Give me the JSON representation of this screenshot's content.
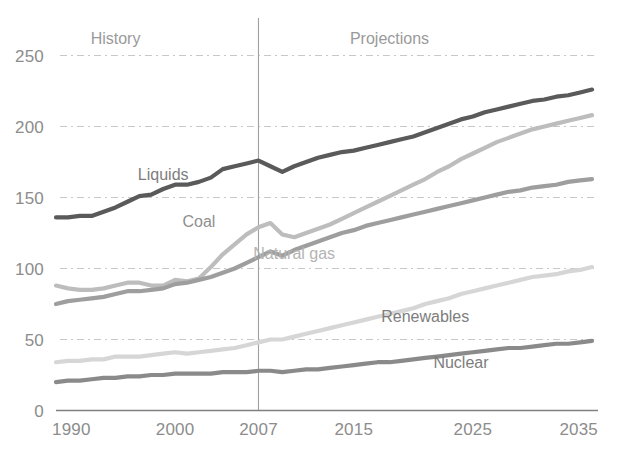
{
  "chart_data": {
    "type": "line",
    "title": "",
    "subtitle": "",
    "xlabel": "",
    "ylabel": "",
    "xlim": [
      1990,
      2035
    ],
    "ylim": [
      0,
      260
    ],
    "grid": true,
    "grid_style": "dashed-horizontal",
    "legend_position": "inline-annotations",
    "x_ticks": [
      "1990",
      "2000",
      "2007",
      "2015",
      "2025",
      "2035"
    ],
    "x_tick_values": [
      1990,
      2000,
      2007,
      2015,
      2025,
      2035
    ],
    "y_ticks": [
      "0",
      "50",
      "100",
      "150",
      "200",
      "250"
    ],
    "y_tick_values": [
      0,
      50,
      100,
      150,
      200,
      250
    ],
    "annotations": [
      {
        "name": "history",
        "text": "History",
        "x": 1995,
        "y": 258
      },
      {
        "name": "projections",
        "text": "Projections",
        "x": 2018,
        "y": 258
      },
      {
        "name": "history-projection-divider",
        "text": "",
        "x": 2007,
        "y": 0
      }
    ],
    "divider_x": 2007,
    "x": [
      1990,
      1991,
      1992,
      1993,
      1994,
      1995,
      1996,
      1997,
      1998,
      1999,
      2000,
      2001,
      2002,
      2003,
      2004,
      2005,
      2006,
      2007,
      2008,
      2009,
      2010,
      2011,
      2012,
      2013,
      2014,
      2015,
      2016,
      2017,
      2018,
      2019,
      2020,
      2021,
      2022,
      2023,
      2024,
      2025,
      2026,
      2027,
      2028,
      2029,
      2030,
      2031,
      2032,
      2033,
      2034,
      2035
    ],
    "series": [
      {
        "name": "Liquids",
        "label": "Liquids",
        "color": "#5a5a5a",
        "label_x": 1999,
        "label_y": 162,
        "values": [
          136,
          136,
          137,
          137,
          140,
          143,
          147,
          151,
          152,
          156,
          159,
          159,
          161,
          164,
          170,
          172,
          174,
          176,
          172,
          168,
          172,
          175,
          178,
          180,
          182,
          183,
          185,
          187,
          189,
          191,
          193,
          196,
          199,
          202,
          205,
          207,
          210,
          212,
          214,
          216,
          218,
          219,
          221,
          222,
          224,
          226
        ]
      },
      {
        "name": "Coal",
        "label": "Coal",
        "color": "#bdbdbd",
        "label_x": 2002,
        "label_y": 129,
        "values": [
          88,
          86,
          85,
          85,
          86,
          88,
          90,
          90,
          88,
          88,
          92,
          91,
          93,
          101,
          110,
          117,
          124,
          129,
          132,
          124,
          122,
          125,
          128,
          131,
          135,
          139,
          143,
          147,
          151,
          155,
          159,
          163,
          168,
          172,
          177,
          181,
          185,
          189,
          192,
          195,
          198,
          200,
          202,
          204,
          206,
          208
        ]
      },
      {
        "name": "Natural gas",
        "label": "Natural gas",
        "color": "#9e9e9e",
        "label_x": 2010,
        "label_y": 107,
        "values": [
          75,
          77,
          78,
          79,
          80,
          82,
          84,
          84,
          85,
          86,
          89,
          90,
          92,
          94,
          97,
          100,
          104,
          108,
          112,
          109,
          113,
          116,
          119,
          122,
          125,
          127,
          130,
          132,
          134,
          136,
          138,
          140,
          142,
          144,
          146,
          148,
          150,
          152,
          154,
          155,
          157,
          158,
          159,
          161,
          162,
          163
        ]
      },
      {
        "name": "Renewables",
        "label": "Renewables",
        "color": "#d6d6d6",
        "label_x": 2021,
        "label_y": 62,
        "values": [
          34,
          35,
          35,
          36,
          36,
          38,
          38,
          38,
          39,
          40,
          41,
          40,
          41,
          42,
          43,
          44,
          46,
          48,
          50,
          50,
          52,
          54,
          56,
          58,
          60,
          62,
          64,
          66,
          68,
          70,
          72,
          75,
          77,
          79,
          82,
          84,
          86,
          88,
          90,
          92,
          94,
          95,
          96,
          98,
          99,
          101
        ]
      },
      {
        "name": "Nuclear",
        "label": "Nuclear",
        "color": "#8a8a8a",
        "label_x": 2024,
        "label_y": 30,
        "values": [
          20,
          21,
          21,
          22,
          23,
          23,
          24,
          24,
          25,
          25,
          26,
          26,
          26,
          26,
          27,
          27,
          27,
          28,
          28,
          27,
          28,
          29,
          29,
          30,
          31,
          32,
          33,
          34,
          34,
          35,
          36,
          37,
          38,
          39,
          40,
          41,
          42,
          43,
          44,
          44,
          45,
          46,
          47,
          47,
          48,
          49
        ]
      }
    ]
  },
  "colors": {
    "axis": "#8c8c8c",
    "grid": "#c8c8c8",
    "divider": "#a0a0a0",
    "background": "#ffffff"
  }
}
